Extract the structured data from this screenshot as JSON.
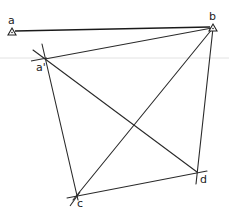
{
  "diagram": {
    "type": "survey-triangulation-sketch",
    "colors": {
      "line": "#2a2a2a",
      "guide": "#e2e2e2",
      "background": "#ffffff"
    },
    "stations": [
      {
        "id": "a",
        "label": "a",
        "marker": "triangle",
        "x": 12,
        "y": 31
      },
      {
        "id": "b",
        "label": "b",
        "marker": "triangle",
        "x": 213,
        "y": 27
      }
    ],
    "points": [
      {
        "id": "a_prime",
        "label": "a'",
        "x": 45,
        "y": 59
      },
      {
        "id": "c",
        "label": "c",
        "x": 77,
        "y": 195
      },
      {
        "id": "d",
        "label": "d",
        "x": 197,
        "y": 172
      }
    ],
    "lines": [
      {
        "from": "a",
        "to": "b"
      },
      {
        "from": "a_prime",
        "to": "b"
      },
      {
        "from": "a_prime",
        "to": "c"
      },
      {
        "from": "a_prime",
        "to": "d"
      },
      {
        "from": "b",
        "to": "c"
      },
      {
        "from": "b",
        "to": "d"
      },
      {
        "from": "c",
        "to": "d"
      }
    ],
    "guide_line_y": 58
  }
}
